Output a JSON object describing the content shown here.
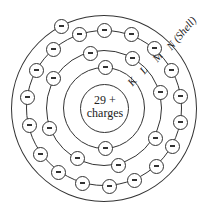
{
  "diagram": {
    "nucleus": {
      "line1": "29 +",
      "line2": "charges"
    },
    "shell_labels": {
      "K": "K",
      "L": "L",
      "M": "M",
      "N": "N (Shell)"
    },
    "electron_symbol": "minus-sign",
    "shells": [
      {
        "name": "K",
        "electrons": 2
      },
      {
        "name": "L",
        "electrons": 8
      },
      {
        "name": "M",
        "electrons": 18
      },
      {
        "name": "N",
        "electrons": 1
      }
    ],
    "colors": {
      "stroke": "#333333",
      "background": "#ffffff"
    }
  }
}
